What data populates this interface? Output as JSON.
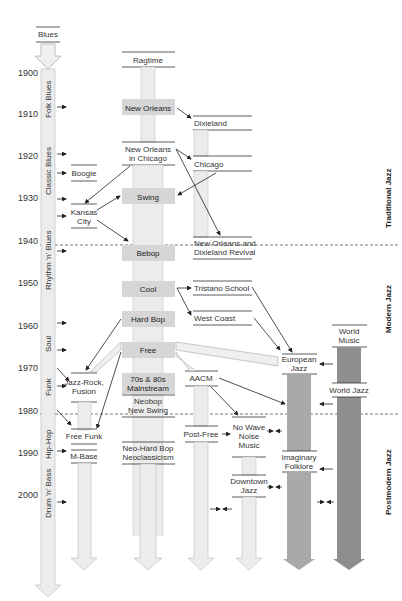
{
  "years": [
    "1900",
    "1910",
    "1920",
    "1930",
    "1940",
    "1950",
    "1960",
    "1970",
    "1980",
    "1990",
    "2000"
  ],
  "origin": "Blues",
  "blues_column": [
    "Folk Blues",
    "Classic Blues",
    "Rhythm 'n' Blues",
    "Soul",
    "Funk",
    "Hip-Hop",
    "Drum 'n' Bass"
  ],
  "styles": {
    "boogie": "Boogie",
    "kansas_1": "Kansas",
    "kansas_2": "City",
    "jazzrock_1": "Jazz-Rock,",
    "jazzrock_2": "Fusion",
    "freefunk": "Free Funk",
    "mbase": "M-Base",
    "ragtime": "Ragtime",
    "neworleans": "New Orleans",
    "noc_1": "New Orleans",
    "noc_2": "in Chicago",
    "swing": "Swing",
    "bebop": "Bebop",
    "cool": "Cool",
    "hardbop": "Hard Bop",
    "free": "Free",
    "mainstream_1": "70s & 80s",
    "mainstream_2": "Mainstream",
    "neobop_1": "Neobop",
    "neobop_2": "New Swing",
    "neohard_1": "Neo-Hard Bop",
    "neohard_2": "Neoclassicism",
    "dixieland": "Dixieland",
    "chicago": "Chicago",
    "revival_1": "New Orleans and",
    "revival_2": "Dixieland Revival",
    "tristano": "Tristano School",
    "westcoast": "West Coast",
    "aacm": "AACM",
    "postfree": "Post-Free",
    "nowave_1": "No Wave",
    "nowave_2": "Noise",
    "nowave_3": "Music",
    "downtown_1": "Downtown",
    "downtown_2": "Jazz",
    "european_1": "European",
    "european_2": "Jazz",
    "imaginary_1": "Imaginary",
    "imaginary_2": "Folklore",
    "worldmusic_1": "World",
    "worldmusic_2": "Music",
    "worldjazz": "World Jazz"
  },
  "eras": [
    "Traditional Jazz",
    "Modern Jazz",
    "Postmodern Jazz"
  ],
  "colors": {
    "light_column": "#ececec",
    "highlight_box": "#d6d6d6",
    "european_column": "#a9a9a9",
    "world_column": "#8e8e8e",
    "line": "#222222"
  }
}
